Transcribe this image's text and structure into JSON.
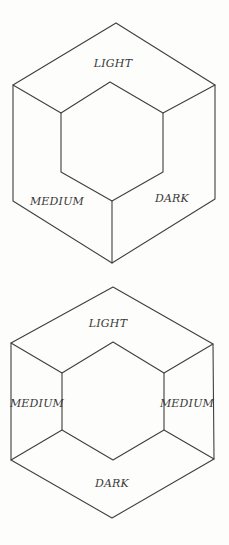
{
  "style": {
    "line_color": "#3f3f3f",
    "text_color": "#383838",
    "paper_color": "#fdfdfb"
  },
  "figures": [
    {
      "id": "top-hexagon-cube-view",
      "description": "hexagonal wireframe seen as cube corner-on, three faces",
      "labels": {
        "top_face": "LIGHT",
        "lower_left_face": "MEDIUM",
        "lower_right_face": "DARK"
      }
    },
    {
      "id": "bottom-hexagon-tube-view",
      "description": "hexagonal wireframe seen as hexagonal tube, four faces",
      "labels": {
        "top_face": "LIGHT",
        "left_face": "MEDIUM",
        "right_face": "MEDIUM",
        "bottom_face": "DARK"
      }
    }
  ]
}
